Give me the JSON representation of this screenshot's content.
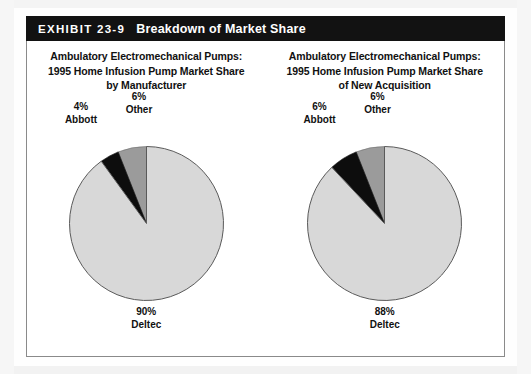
{
  "exhibit": {
    "number": "EXHIBIT 23-9",
    "title": "Breakdown of Market Share"
  },
  "charts": [
    {
      "title_line1": "Ambulatory Electromechanical Pumps:",
      "title_line2": "1995 Home Infusion Pump Market Share",
      "title_line3": "by Manufacturer",
      "labels": {
        "abbott_value": "4%",
        "abbott_name": "Abbott",
        "other_value": "6%",
        "other_name": "Other",
        "deltec_value": "90%",
        "deltec_name": "Deltec"
      }
    },
    {
      "title_line1": "Ambulatory Electromechanical Pumps:",
      "title_line2": "1995 Home Infusion Pump Market Share",
      "title_line3": "of New Acquisition",
      "labels": {
        "abbott_value": "6%",
        "abbott_name": "Abbott",
        "other_value": "6%",
        "other_name": "Other",
        "deltec_value": "88%",
        "deltec_name": "Deltec"
      }
    }
  ],
  "chart_data": [
    {
      "type": "pie",
      "title": "Ambulatory Electromechanical Pumps: 1995 Home Infusion Pump Market Share by Manufacturer",
      "categories": [
        "Other",
        "Abbott",
        "Deltec"
      ],
      "values": [
        6,
        4,
        90
      ],
      "unit": "percent",
      "colors": [
        "#9b9b9b",
        "#0d0d0d",
        "#d8d8d8"
      ],
      "start_angle_deg": 90,
      "direction": "counterclockwise",
      "legend": "none",
      "data_labels": [
        "6% Other",
        "4% Abbott",
        "90% Deltec"
      ]
    },
    {
      "type": "pie",
      "title": "Ambulatory Electromechanical Pumps: 1995 Home Infusion Pump Market Share of New Acquisition",
      "categories": [
        "Other",
        "Abbott",
        "Deltec"
      ],
      "values": [
        6,
        6,
        88
      ],
      "unit": "percent",
      "colors": [
        "#9b9b9b",
        "#0d0d0d",
        "#d8d8d8"
      ],
      "start_angle_deg": 90,
      "direction": "counterclockwise",
      "legend": "none",
      "data_labels": [
        "6% Other",
        "6% Abbott",
        "88% Deltec"
      ]
    }
  ],
  "colors": {
    "header_bg": "#121212",
    "header_text": "#ffffff",
    "frame_border": "#8a8a8a",
    "slice_deltec": "#d8d8d8",
    "slice_other": "#9b9b9b",
    "slice_abbott": "#0d0d0d",
    "slice_outline": "#5a5a5a",
    "text": "#111111"
  }
}
